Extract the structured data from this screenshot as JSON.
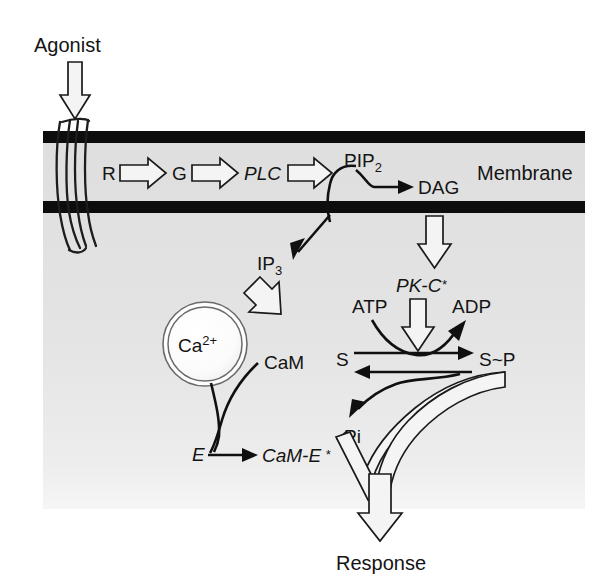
{
  "figure": {
    "background_color": "#ffffff",
    "panel_color": "#e3e3e3",
    "membrane_color": "#0d0d0d",
    "line_color": "#101010"
  },
  "labels": {
    "agonist": "Agonist",
    "receptor": "R",
    "g_protein": "G",
    "plc": "PLC",
    "pip2_base": "PIP",
    "pip2_sub": "2",
    "dag": "DAG",
    "membrane": "Membrane",
    "ip3_base": "IP",
    "ip3_sub": "3",
    "pkc": "PK-C",
    "pkc_star": "*",
    "calcium_base": "Ca",
    "calcium_sup": "2+",
    "cam": "CaM",
    "atp": "ATP",
    "adp": "ADP",
    "substrate": "S",
    "substrate_phos": "S~P",
    "pi": "Pi",
    "enzyme": "E",
    "cam_e": "CaM-E",
    "cam_e_star": "*",
    "response": "Response"
  },
  "pathway": {
    "steps": [
      {
        "from": "Agonist",
        "to": "R",
        "arrow": "open-down"
      },
      {
        "from": "R",
        "to": "G",
        "arrow": "open-right"
      },
      {
        "from": "G",
        "to": "PLC",
        "arrow": "open-right"
      },
      {
        "from": "PLC",
        "to": "PIP2",
        "arrow": "open-right"
      },
      {
        "from": "PIP2",
        "to": "DAG",
        "arrow": "solid-right"
      },
      {
        "from": "PIP2",
        "to": "IP3",
        "arrow": "solid-diagonal-down"
      },
      {
        "from": "DAG",
        "to": "PK-C*",
        "arrow": "open-down"
      },
      {
        "from": "IP3",
        "to": "Ca2+ store",
        "arrow": "open-diagonal-down"
      },
      {
        "from": "Ca2+ / CaM",
        "to": "CaM-E*",
        "arrow": "solid-curve-converge"
      },
      {
        "from": "E",
        "to": "CaM-E*",
        "arrow": "solid-right"
      },
      {
        "from": "PK-C*",
        "to": "S to S~P",
        "arrow": "open-down"
      },
      {
        "from": "ATP",
        "to": "ADP",
        "arrow": "solid-curve-forward"
      },
      {
        "from": "S",
        "to": "S~P",
        "arrow": "solid-right"
      },
      {
        "from": "S~P",
        "to": "S",
        "arrow": "solid-left"
      },
      {
        "from": "S~P",
        "to": "Pi",
        "arrow": "solid-curve-reverse"
      },
      {
        "from": "CaM-E* and S~P",
        "to": "Response",
        "arrow": "open-merge-down"
      }
    ]
  }
}
